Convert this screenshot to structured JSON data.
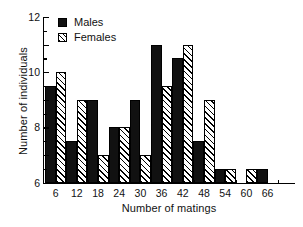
{
  "chart_data": {
    "type": "bar",
    "title": "",
    "xlabel": "Number of matings",
    "ylabel": "Number of individuals",
    "categories": [
      "6",
      "12",
      "18",
      "24",
      "30",
      "36",
      "42",
      "48",
      "54",
      "60",
      "66"
    ],
    "series": [
      {
        "name": "Males",
        "values": [
          7,
          3,
          6,
          4,
          6,
          10,
          9,
          3,
          1,
          0,
          1
        ]
      },
      {
        "name": "Females",
        "values": [
          8,
          6,
          2,
          4,
          2,
          7,
          10,
          6,
          1,
          1,
          0
        ]
      }
    ],
    "ylim": [
      0,
      12
    ],
    "yticks": [
      0,
      2,
      4,
      6,
      8,
      10,
      12
    ],
    "yminorticks": [
      1,
      3,
      5,
      7,
      9,
      11
    ],
    "grid": false,
    "legend_position": "top-left",
    "legend": [
      "Males",
      "Females"
    ],
    "colors": {
      "males": "#111111",
      "females_fill": "#ffffff",
      "females_hatch": "#000000",
      "axis": "#000000"
    }
  },
  "axis": {
    "y_title": "Number of individuals",
    "x_title": "Number of matings",
    "y_tick_labels": [
      "0",
      "2",
      "4",
      "6",
      "8",
      "10",
      "12"
    ],
    "x_tick_labels": [
      "6",
      "12",
      "18",
      "24",
      "30",
      "36",
      "42",
      "48",
      "54",
      "60",
      "66"
    ]
  },
  "legend": {
    "items": [
      {
        "label": "Males",
        "style": "solid"
      },
      {
        "label": "Females",
        "style": "hatched"
      }
    ]
  },
  "caption": {
    "remnant": ""
  }
}
